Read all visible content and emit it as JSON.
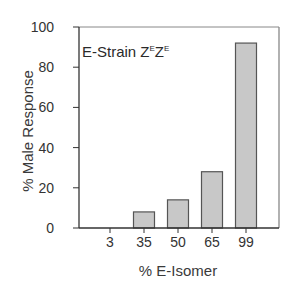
{
  "chart_data": {
    "type": "bar",
    "title": "",
    "annotation": {
      "prefix": "E-Strain Z",
      "sup1": "E",
      "mid": "Z",
      "sup2": "E",
      "full": "E-Strain Z^E Z^E"
    },
    "xlabel": "% E-Isomer",
    "ylabel": "% Male Response",
    "categories": [
      "3",
      "35",
      "50",
      "65",
      "99"
    ],
    "values": [
      0,
      8,
      14,
      28,
      92
    ],
    "ylim": [
      0,
      100
    ],
    "yticks": [
      0,
      20,
      40,
      60,
      80,
      100
    ],
    "grid": false,
    "legend": null,
    "colors": {
      "bar_fill": "#c8c8c8",
      "bar_edge": "#555555",
      "axis": "#333333",
      "frame": "#888888"
    }
  }
}
